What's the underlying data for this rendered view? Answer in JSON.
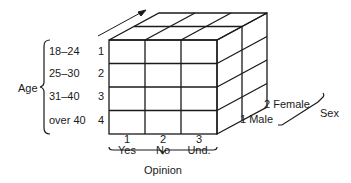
{
  "diagram": {
    "type": "3D contingency cube",
    "age": {
      "title": "Age",
      "levels": [
        {
          "label": "18–24",
          "code": "1"
        },
        {
          "label": "25–30",
          "code": "2"
        },
        {
          "label": "31–40",
          "code": "3"
        },
        {
          "label": "over 40",
          "code": "4"
        }
      ]
    },
    "opinion": {
      "title": "Opinion",
      "levels": [
        {
          "label": "Yes",
          "code": "1"
        },
        {
          "label": "No",
          "code": "2"
        },
        {
          "label": "Und.",
          "code": "3"
        }
      ]
    },
    "sex": {
      "title": "Sex",
      "levels": [
        {
          "label": "Male",
          "code": "1",
          "text": "1 Male"
        },
        {
          "label": "Female",
          "code": "2",
          "text": "2 Female"
        }
      ]
    },
    "colors": {
      "line": "#1a1a1a",
      "background": "#ffffff"
    }
  }
}
